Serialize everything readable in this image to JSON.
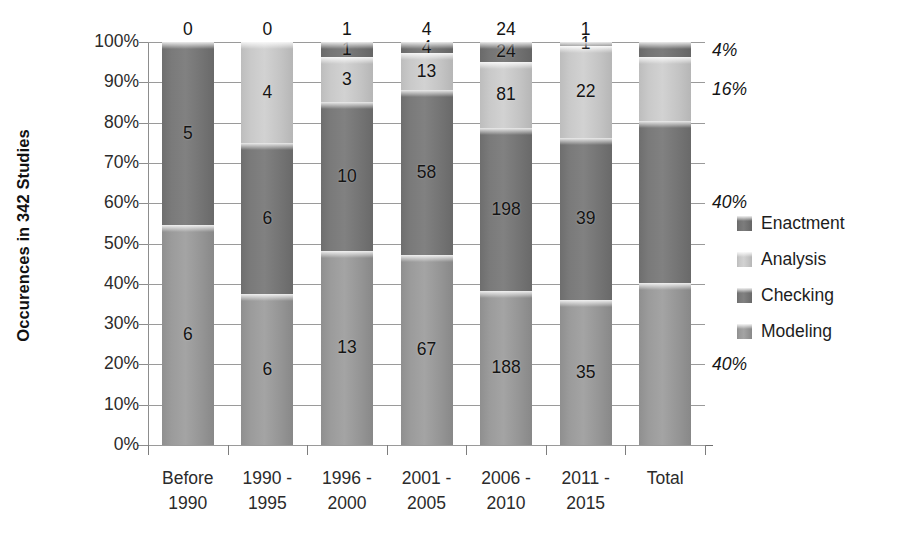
{
  "chart_data": {
    "type": "bar",
    "subtype": "stacked-100-percent",
    "title": "",
    "xlabel": "",
    "ylabel": "Occurences in 342 Studies",
    "ylim": [
      0,
      100
    ],
    "ytick_labels": [
      "100%",
      "90%",
      "80%",
      "70%",
      "60%",
      "50%",
      "40%",
      "30%",
      "20%",
      "10%",
      "0%"
    ],
    "ytick_values": [
      100,
      90,
      80,
      70,
      60,
      50,
      40,
      30,
      20,
      10,
      0
    ],
    "grid": true,
    "legend_position": "right",
    "categories": [
      "Before 1990",
      "1990 - 1995",
      "1996 - 2000",
      "2001 - 2005",
      "2006 - 2010",
      "2011 - 2015",
      "Total"
    ],
    "category_lines": [
      [
        "Before",
        "1990"
      ],
      [
        "1990 -",
        "1995"
      ],
      [
        "1996 -",
        "2000"
      ],
      [
        "2001 -",
        "2005"
      ],
      [
        "2006 -",
        "2010"
      ],
      [
        "2011 -",
        "2015"
      ],
      [
        "Total",
        ""
      ]
    ],
    "series": [
      {
        "name": "Modeling",
        "color": "#9b9b9b",
        "values": [
          6,
          6,
          13,
          67,
          188,
          35,
          315
        ]
      },
      {
        "name": "Checking",
        "color": "#7a7a7a",
        "values": [
          5,
          6,
          10,
          58,
          198,
          39,
          316
        ]
      },
      {
        "name": "Analysis",
        "color": "#c9c9c9",
        "values": [
          0,
          4,
          3,
          13,
          81,
          22,
          123
        ]
      },
      {
        "name": "Enactment",
        "color": "#757575",
        "values": [
          0,
          0,
          1,
          4,
          24,
          1,
          30
        ]
      }
    ],
    "legend_entries": [
      "Enactment",
      "Analysis",
      "Checking",
      "Modeling"
    ],
    "bar_labels": [
      {
        "category": "Before 1990",
        "modeling": "6",
        "checking": "5",
        "analysis": "",
        "enactment": "0"
      },
      {
        "category": "1990 - 1995",
        "modeling": "6",
        "checking": "6",
        "analysis": "4",
        "enactment": "0"
      },
      {
        "category": "1996 - 2000",
        "modeling": "13",
        "checking": "10",
        "analysis": "3",
        "enactment": "1"
      },
      {
        "category": "2001 - 2005",
        "modeling": "67",
        "checking": "58",
        "analysis": "13",
        "enactment": "4"
      },
      {
        "category": "2006 - 2010",
        "modeling": "188",
        "checking": "198",
        "analysis": "81",
        "enactment": "24"
      },
      {
        "category": "2011 - 2015",
        "modeling": "35",
        "checking": "39",
        "analysis": "22",
        "enactment": "1"
      },
      {
        "category": "Total",
        "modeling": "",
        "checking": "",
        "analysis": "",
        "enactment": ""
      }
    ],
    "total_percent_annotations": [
      {
        "label": "4%",
        "series": "Enactment"
      },
      {
        "label": "16%",
        "series": "Analysis"
      },
      {
        "label": "40%",
        "series": "Checking"
      },
      {
        "label": "40%",
        "series": "Modeling"
      }
    ]
  }
}
